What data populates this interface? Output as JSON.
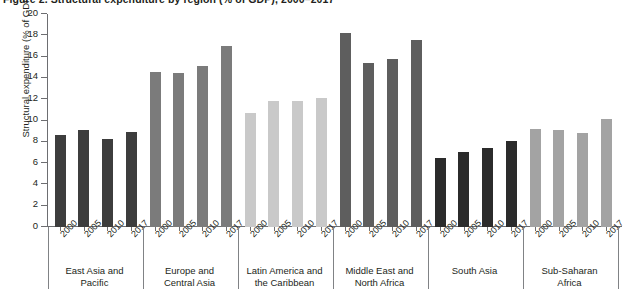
{
  "figure": {
    "clipped_top_title": "Figure 2. Structural expenditure by region (% of GDP), 2000–2017",
    "y_axis_title": "Structural expenditure (% of GDP)"
  },
  "chart_data": {
    "type": "bar",
    "title": "",
    "xlabel": "",
    "ylabel": "Structural expenditure (% of GDP)",
    "ylim": [
      0,
      20
    ],
    "ytick_labels": [
      "0",
      "2",
      "4",
      "6",
      "8",
      "10",
      "12",
      "14",
      "16",
      "18",
      "20"
    ],
    "ytick_values": [
      0,
      2,
      4,
      6,
      8,
      10,
      12,
      14,
      16,
      18,
      20
    ],
    "grid": false,
    "legend": "none",
    "categories": [
      "2000",
      "2005",
      "2010",
      "2017"
    ],
    "groups": [
      {
        "name": "East Asia and\nPacific",
        "color": "#3d3d3d",
        "values": [
          8.6,
          9.1,
          8.3,
          8.9
        ]
      },
      {
        "name": "Europe and\nCentral Asia",
        "color": "#7b7b7b",
        "values": [
          14.6,
          14.5,
          15.1,
          17.0
        ]
      },
      {
        "name": "Latin America and\nthe Caribbean",
        "color": "#c9c9c9",
        "values": [
          10.7,
          11.8,
          11.8,
          12.1
        ]
      },
      {
        "name": "Middle East and\nNorth Africa",
        "color": "#5e5e5e",
        "values": [
          18.2,
          15.4,
          15.8,
          17.6
        ]
      },
      {
        "name": "South Asia",
        "color": "#2b2b2b",
        "values": [
          6.5,
          7.0,
          7.4,
          8.1
        ]
      },
      {
        "name": "Sub-Saharan\nAfrica",
        "color": "#a3a3a3",
        "values": [
          9.2,
          9.1,
          8.8,
          10.1
        ]
      }
    ]
  }
}
